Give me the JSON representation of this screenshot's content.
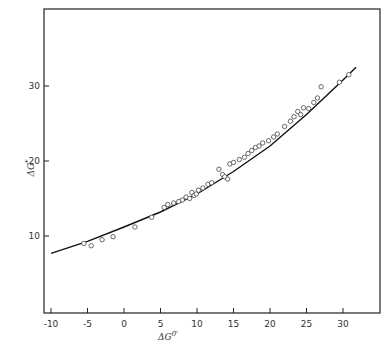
{
  "chart_data": {
    "type": "scatter",
    "title": "",
    "xlabel": "ΔG0'",
    "ylabel": "ΔG*",
    "xlim": [
      -11,
      34
    ],
    "ylim": [
      0,
      40
    ],
    "xticks": [
      -10,
      -5,
      0,
      5,
      10,
      15,
      20,
      25,
      30
    ],
    "yticks": [
      10,
      20,
      30
    ],
    "grid": false,
    "legend": null,
    "series": [
      {
        "name": "observed",
        "marker": "open-circle",
        "points": [
          [
            -5.5,
            9.0
          ],
          [
            -4.5,
            8.7
          ],
          [
            -3.0,
            9.5
          ],
          [
            -1.5,
            9.9
          ],
          [
            1.5,
            11.2
          ],
          [
            3.8,
            12.5
          ],
          [
            5.5,
            13.8
          ],
          [
            6.0,
            14.2
          ],
          [
            6.8,
            14.4
          ],
          [
            7.5,
            14.6
          ],
          [
            8.0,
            14.8
          ],
          [
            8.5,
            15.2
          ],
          [
            9.0,
            15.0
          ],
          [
            9.3,
            15.8
          ],
          [
            9.6,
            15.4
          ],
          [
            9.9,
            15.6
          ],
          [
            10.2,
            16.1
          ],
          [
            10.8,
            16.4
          ],
          [
            11.5,
            16.9
          ],
          [
            12.0,
            17.1
          ],
          [
            13.0,
            18.9
          ],
          [
            13.5,
            18.2
          ],
          [
            13.8,
            17.9
          ],
          [
            14.2,
            17.6
          ],
          [
            14.5,
            19.6
          ],
          [
            15.0,
            19.8
          ],
          [
            15.8,
            20.2
          ],
          [
            16.5,
            20.5
          ],
          [
            17.0,
            21.0
          ],
          [
            17.5,
            21.4
          ],
          [
            18.0,
            21.8
          ],
          [
            18.5,
            22.0
          ],
          [
            19.0,
            22.4
          ],
          [
            19.8,
            22.7
          ],
          [
            20.5,
            23.2
          ],
          [
            21.0,
            23.6
          ],
          [
            22.0,
            24.6
          ],
          [
            22.8,
            25.3
          ],
          [
            23.3,
            25.9
          ],
          [
            23.8,
            26.6
          ],
          [
            24.2,
            26.2
          ],
          [
            24.6,
            27.1
          ],
          [
            25.3,
            27.0
          ],
          [
            26.0,
            27.8
          ],
          [
            26.5,
            28.4
          ],
          [
            27.0,
            29.9
          ],
          [
            29.5,
            30.5
          ],
          [
            30.8,
            31.5
          ]
        ]
      },
      {
        "name": "fit",
        "type": "line",
        "points": [
          [
            -10,
            7.7
          ],
          [
            -5,
            9.3
          ],
          [
            0,
            11.2
          ],
          [
            5,
            13.2
          ],
          [
            10,
            15.6
          ],
          [
            15,
            18.6
          ],
          [
            20,
            22.0
          ],
          [
            25,
            26.2
          ],
          [
            30,
            30.8
          ],
          [
            31.8,
            32.5
          ]
        ]
      }
    ]
  }
}
